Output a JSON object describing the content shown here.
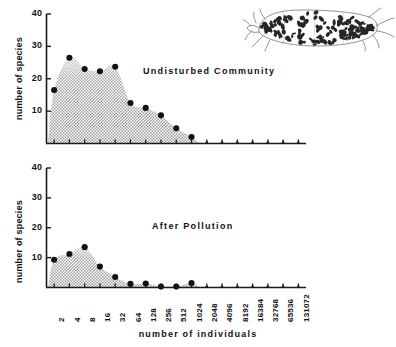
{
  "figure": {
    "xlabel": "number of individuals",
    "ylabel": "number of species",
    "illustration_name": "spotted-marine-organism-illustration"
  },
  "panels": [
    {
      "id": "undisturbed",
      "title": "Undisturbed  Community"
    },
    {
      "id": "polluted",
      "title": "After  Pollution"
    }
  ],
  "axis": {
    "y_ticks": [
      "10",
      "20",
      "30",
      "40"
    ],
    "x_ticks": [
      "2",
      "4",
      "8",
      "16",
      "32",
      "64",
      "128",
      "256",
      "512",
      "1024",
      "2048",
      "4096",
      "8192",
      "16384",
      "32768",
      "65536",
      "131072"
    ]
  },
  "chart_data": {
    "type": "scatter",
    "xlabel": "number of individuals",
    "ylabel": "number of species",
    "xscale": "log2",
    "x": [
      2,
      4,
      8,
      16,
      32,
      64,
      128,
      256,
      512,
      1024,
      2048,
      4096,
      8192,
      16384,
      32768,
      65536,
      131072
    ],
    "ylim": [
      0,
      40
    ],
    "yticks": [
      10,
      20,
      30,
      40
    ],
    "grid": false,
    "legend": false,
    "series": [
      {
        "name": "Undisturbed  Community",
        "panel": "undisturbed",
        "fill": "stipple",
        "values": [
          16.5,
          26.5,
          23.0,
          22.3,
          23.7,
          12.5,
          11.0,
          8.7,
          4.7,
          2.0,
          0,
          0,
          0,
          0,
          0,
          0,
          0
        ]
      },
      {
        "name": "After  Pollution",
        "panel": "polluted",
        "fill": "stipple",
        "values": [
          9.3,
          11.2,
          13.5,
          7.0,
          3.5,
          1.2,
          1.3,
          0.3,
          0.3,
          1.5,
          0,
          0,
          0,
          0,
          0,
          0,
          0
        ]
      }
    ]
  },
  "colors": {
    "ink": "#111111",
    "stipple": "#b8b8b8",
    "axis": "#1a1a1a"
  }
}
